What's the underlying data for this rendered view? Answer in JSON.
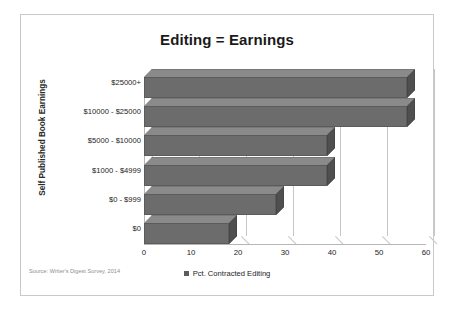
{
  "card": {
    "border_color": "#c9c9c9",
    "background": "#ffffff"
  },
  "source_note": "Source: Writer's Digest Survey, 2014",
  "legend": {
    "marker_icon": "legend-square-icon",
    "marker_color": "#5c5c5c",
    "label": "Pct. Contracted Editing"
  },
  "chart_data": {
    "type": "bar",
    "orientation": "horizontal",
    "title": "Editing = Earnings",
    "xlabel": "",
    "ylabel": "Self Published Book Earnings",
    "categories": [
      "$0",
      "$0 - $999",
      "$1000 - $4999",
      "$5000 - $10000",
      "$10000 - $25000",
      "$25000+"
    ],
    "series": [
      {
        "name": "Pct. Contracted Editing",
        "values": [
          18,
          28,
          39,
          39,
          56,
          56
        ],
        "color": "#6c6c6c"
      }
    ],
    "xlim": [
      0,
      60
    ],
    "xticks": [
      0,
      10,
      20,
      30,
      40,
      50,
      60
    ],
    "xtick_labels": [
      "0",
      "10",
      "20",
      "30",
      "40",
      "50",
      "60"
    ],
    "grid": true,
    "grid_axis": "x",
    "legend_position": "bottom",
    "style_3d": true
  }
}
